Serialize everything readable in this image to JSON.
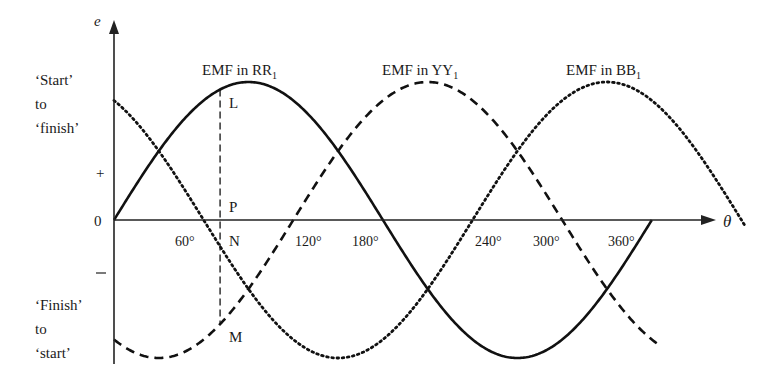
{
  "chart_data": {
    "type": "line",
    "title": "",
    "xlabel": "θ",
    "ylabel": "e",
    "x_unit": "degrees",
    "xlim": [
      0,
      420
    ],
    "ylim": [
      -1,
      1
    ],
    "grid": false,
    "x_ticks": [
      {
        "value": 60,
        "label": "60°"
      },
      {
        "value": 120,
        "label": "120°"
      },
      {
        "value": 180,
        "label": "180°"
      },
      {
        "value": 240,
        "label": "240°"
      },
      {
        "value": 300,
        "label": "300°"
      },
      {
        "value": 360,
        "label": "360°"
      }
    ],
    "y_ticks": [
      {
        "value": 0.5,
        "label": "+"
      },
      {
        "value": 0,
        "label": "0"
      },
      {
        "value": -0.5,
        "label": "–"
      }
    ],
    "y_region_labels": {
      "positive": [
        "‘Start’",
        "to",
        "‘finish’"
      ],
      "negative": [
        "‘Finish’",
        "to",
        "‘start’"
      ]
    },
    "series": [
      {
        "name": "EMF in RR1",
        "label_main": "EMF in RR",
        "label_sub": "1",
        "style": "solid",
        "phase_deg": 0,
        "amplitude": 1,
        "x_range": [
          0,
          360
        ],
        "peak_at_deg": 90
      },
      {
        "name": "EMF in YY1",
        "label_main": "EMF in YY",
        "label_sub": "1",
        "style": "dashed",
        "phase_deg": -120,
        "amplitude": 1,
        "x_range": [
          0,
          365
        ],
        "peak_at_deg": 210
      },
      {
        "name": "EMF in BB1",
        "label_main": "EMF in BB",
        "label_sub": "1",
        "style": "dotted",
        "phase_deg": -240,
        "amplitude": 1,
        "x_range": [
          0,
          422
        ],
        "peak_at_deg": 330
      }
    ],
    "annotations": [
      {
        "text": "L",
        "meaning": "point on RR1 curve at θ≈71°"
      },
      {
        "text": "P",
        "meaning": "point above axis on vertical line"
      },
      {
        "text": "N",
        "meaning": "point below axis on vertical line"
      },
      {
        "text": "M",
        "meaning": "point on YY1 curve at θ≈71°"
      },
      {
        "text": "vertical dashed line LM",
        "at_deg": 71
      }
    ],
    "legend_position": "inline labels above each curve peak"
  },
  "labels": {
    "y_axis": "e",
    "x_axis": "θ",
    "zero": "0",
    "plus": "+",
    "minus": "–",
    "start_to_finish": [
      "‘Start’",
      "to",
      "‘finish’"
    ],
    "finish_to_start": [
      "‘Finish’",
      "to",
      "‘start’"
    ],
    "points": {
      "L": "L",
      "P": "P",
      "N": "N",
      "M": "M"
    }
  }
}
